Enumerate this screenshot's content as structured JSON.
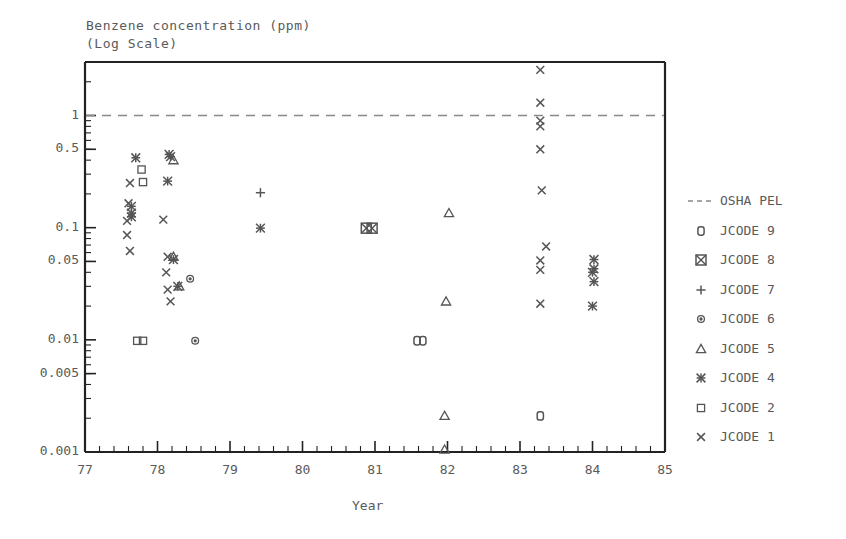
{
  "chart_data": {
    "type": "scatter",
    "title": "Benzene concentration (ppm)",
    "subtitle": "(Log Scale)",
    "xlabel": "Year",
    "ylabel": "Benzene concentration (ppm) (Log Scale)",
    "xlim": [
      77,
      85
    ],
    "ylim": [
      0.001,
      3.0
    ],
    "yscale": "log",
    "grid": false,
    "legend_position": "right",
    "xticks": [
      77,
      78,
      79,
      80,
      81,
      82,
      83,
      84,
      85
    ],
    "xticklabels": [
      "77",
      "78",
      "79",
      "80",
      "81",
      "82",
      "83",
      "84",
      "85"
    ],
    "yticks": [
      1,
      0.5,
      0.1,
      0.05,
      0.01,
      0.005,
      0.001
    ],
    "yticklabels": [
      "1",
      "0.5",
      "0.1",
      "0.05",
      "0.01",
      "0.005",
      "0.001"
    ],
    "x_minor_ticks_per_interval": 5,
    "reference_line": {
      "label": "OSHA PEL",
      "value": 1.0,
      "style": "dashed",
      "color": "#888888"
    },
    "series": [
      {
        "name": "JCODE 9",
        "marker": "open-rounded-square",
        "points": [
          {
            "x": 81.58,
            "y": 0.0098
          },
          {
            "x": 81.66,
            "y": 0.0098
          },
          {
            "x": 83.28,
            "y": 0.0021
          }
        ]
      },
      {
        "name": "JCODE 8",
        "marker": "square-with-x",
        "points": [
          {
            "x": 80.88,
            "y": 0.099
          },
          {
            "x": 80.96,
            "y": 0.099
          }
        ]
      },
      {
        "name": "JCODE 7",
        "marker": "plus",
        "points": [
          {
            "x": 79.42,
            "y": 0.205
          }
        ]
      },
      {
        "name": "JCODE 6",
        "marker": "small-circle",
        "points": [
          {
            "x": 78.45,
            "y": 0.035
          },
          {
            "x": 78.52,
            "y": 0.0098
          }
        ]
      },
      {
        "name": "JCODE 5",
        "marker": "triangle",
        "points": [
          {
            "x": 78.22,
            "y": 0.4
          },
          {
            "x": 78.22,
            "y": 0.055
          },
          {
            "x": 78.3,
            "y": 0.03
          },
          {
            "x": 82.02,
            "y": 0.135
          },
          {
            "x": 81.98,
            "y": 0.022
          },
          {
            "x": 81.96,
            "y": 0.0021
          },
          {
            "x": 81.96,
            "y": 0.00105
          }
        ]
      },
      {
        "name": "JCODE 4",
        "marker": "asterisk",
        "points": [
          {
            "x": 77.7,
            "y": 0.42
          },
          {
            "x": 77.64,
            "y": 0.155
          },
          {
            "x": 77.64,
            "y": 0.135
          },
          {
            "x": 77.64,
            "y": 0.125
          },
          {
            "x": 78.16,
            "y": 0.45
          },
          {
            "x": 78.18,
            "y": 0.43
          },
          {
            "x": 78.14,
            "y": 0.26
          },
          {
            "x": 78.22,
            "y": 0.052
          },
          {
            "x": 78.28,
            "y": 0.03
          },
          {
            "x": 79.42,
            "y": 0.099
          },
          {
            "x": 84.02,
            "y": 0.052
          },
          {
            "x": 84.02,
            "y": 0.043
          },
          {
            "x": 84.0,
            "y": 0.04
          },
          {
            "x": 84.02,
            "y": 0.033
          },
          {
            "x": 84.0,
            "y": 0.02
          }
        ]
      },
      {
        "name": "JCODE 2",
        "marker": "small-square",
        "points": [
          {
            "x": 77.78,
            "y": 0.33
          },
          {
            "x": 77.8,
            "y": 0.255
          },
          {
            "x": 77.72,
            "y": 0.0098
          },
          {
            "x": 77.8,
            "y": 0.0098
          }
        ]
      },
      {
        "name": "JCODE 1",
        "marker": "x-cross",
        "points": [
          {
            "x": 77.62,
            "y": 0.25
          },
          {
            "x": 77.6,
            "y": 0.165
          },
          {
            "x": 77.58,
            "y": 0.115
          },
          {
            "x": 77.58,
            "y": 0.086
          },
          {
            "x": 77.62,
            "y": 0.062
          },
          {
            "x": 78.08,
            "y": 0.118
          },
          {
            "x": 78.14,
            "y": 0.055
          },
          {
            "x": 78.12,
            "y": 0.04
          },
          {
            "x": 78.14,
            "y": 0.028
          },
          {
            "x": 78.18,
            "y": 0.022
          },
          {
            "x": 83.28,
            "y": 2.55
          },
          {
            "x": 83.28,
            "y": 1.3
          },
          {
            "x": 83.28,
            "y": 0.9
          },
          {
            "x": 83.28,
            "y": 0.8
          },
          {
            "x": 83.28,
            "y": 0.5
          },
          {
            "x": 83.3,
            "y": 0.215
          },
          {
            "x": 83.36,
            "y": 0.068
          },
          {
            "x": 83.28,
            "y": 0.051
          },
          {
            "x": 83.28,
            "y": 0.042
          },
          {
            "x": 83.28,
            "y": 0.021
          }
        ]
      }
    ]
  },
  "legend": {
    "entries": [
      {
        "label": "OSHA PEL",
        "marker": "dashed-line"
      },
      {
        "label": "JCODE 9",
        "marker": "open-rounded-square"
      },
      {
        "label": "JCODE 8",
        "marker": "square-with-x"
      },
      {
        "label": "JCODE 7",
        "marker": "plus"
      },
      {
        "label": "JCODE 6",
        "marker": "small-circle"
      },
      {
        "label": "JCODE 5",
        "marker": "triangle"
      },
      {
        "label": "JCODE 4",
        "marker": "asterisk"
      },
      {
        "label": "JCODE 2",
        "marker": "small-square"
      },
      {
        "label": "JCODE 1",
        "marker": "x-cross"
      }
    ]
  },
  "colors": {
    "ink": "#555555",
    "axis": "#222222",
    "reference_line": "#888888",
    "background": "#ffffff"
  }
}
